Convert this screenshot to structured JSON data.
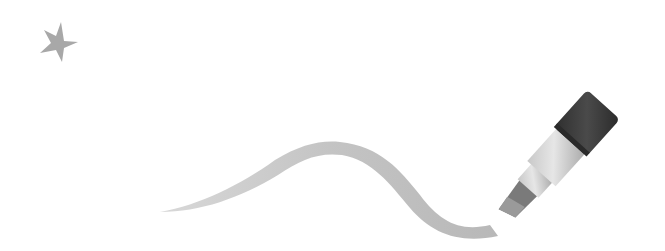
{
  "illustration": {
    "description": "Star with a highlighter marker drawing a wavy stroke",
    "elements": [
      {
        "name": "star",
        "icon": "star-icon"
      },
      {
        "name": "stroke",
        "icon": "wavy-stroke"
      },
      {
        "name": "marker",
        "icon": "marker-icon"
      }
    ]
  },
  "colors": {
    "background": "#ffffff",
    "star": "#a8a8a8",
    "stroke": "#c4c4c4",
    "cap": "#3a3a3a",
    "body_light": "#dcdcdc",
    "body_mid": "#bdbdbd",
    "tip_dark": "#6e6e6e"
  }
}
